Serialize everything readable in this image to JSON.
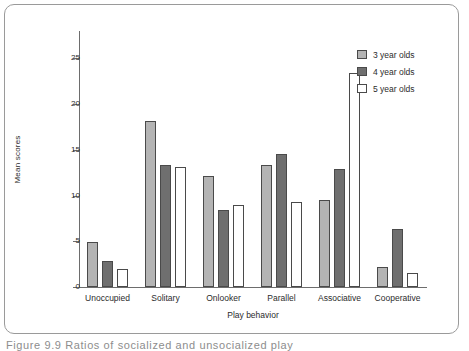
{
  "figure": {
    "caption": "Figure 9.9    Ratios of socialized and unsocialized play",
    "frame_color": "#9a9a9a",
    "background": "#ffffff"
  },
  "legend": {
    "position": "top-right",
    "entries": [
      {
        "label": "3 year olds",
        "swatch": "light-gray-swatch",
        "color": "#b4b4b4"
      },
      {
        "label": "4 year olds",
        "swatch": "dark-gray-swatch",
        "color": "#6f6f6f"
      },
      {
        "label": "5 year olds",
        "swatch": "white-swatch",
        "color": "#ffffff"
      }
    ]
  },
  "chart_data": {
    "type": "bar",
    "title": "",
    "xlabel": "Play behavior",
    "ylabel": "Mean scores",
    "ylim": [
      0,
      28
    ],
    "yticks": [
      0,
      5,
      10,
      15,
      20,
      25
    ],
    "ytick_labels": [
      "0",
      "5",
      "10",
      "15",
      "20",
      "25"
    ],
    "grid": false,
    "legend_position": "top-right",
    "categories": [
      "Unoccupied",
      "Solitary",
      "Onlooker",
      "Parallel",
      "Associative",
      "Cooperative"
    ],
    "series": [
      {
        "name": "3 year olds",
        "color": "#b4b4b4",
        "values": [
          4.9,
          18.2,
          12.1,
          13.4,
          9.5,
          2.2
        ]
      },
      {
        "name": "4 year olds",
        "color": "#6f6f6f",
        "values": [
          2.8,
          13.4,
          8.4,
          14.6,
          12.9,
          6.4
        ]
      },
      {
        "name": "5 year olds",
        "color": "#ffffff",
        "values": [
          2.0,
          13.1,
          9.0,
          9.3,
          23.4,
          1.5
        ]
      }
    ]
  }
}
